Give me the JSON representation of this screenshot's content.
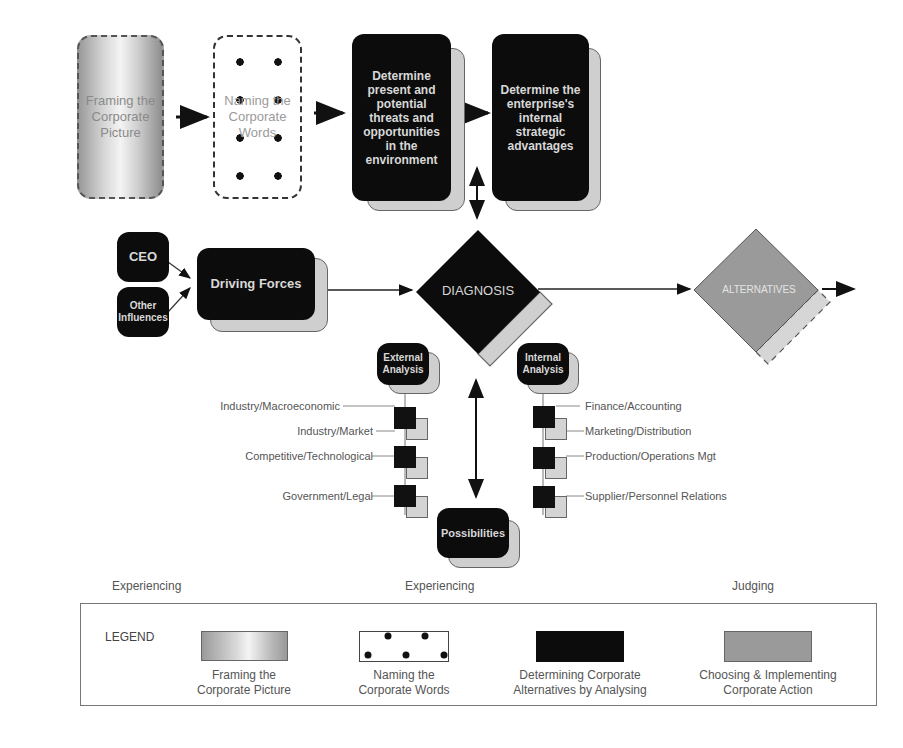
{
  "flow_top": {
    "framing": "Framing the Corporate Picture",
    "naming": "Naming the Corporate Words",
    "threats": "Determine present and potential threats and opportunities in the environment",
    "advantages": "Determine the enterprise's internal strategic advantages"
  },
  "inputs": {
    "ceo": "CEO",
    "other": "Other Influences",
    "driving_forces": "Driving Forces"
  },
  "decision": {
    "diagnosis": "DIAGNOSIS",
    "alternatives": "ALTERNATIVES"
  },
  "external": {
    "title": "External Analysis",
    "items": [
      "Industry/Macroeconomic",
      "Industry/Market",
      "Competitive/Technological",
      "Government/Legal"
    ]
  },
  "internal": {
    "title": "Internal Analysis",
    "items": [
      "Finance/Accounting",
      "Marketing/Distribution",
      "Production/Operations Mgt",
      "Supplier/Personnel Relations"
    ]
  },
  "possibilities": "Possibilities",
  "phases": [
    "Experiencing",
    "Experiencing",
    "Judging"
  ],
  "legend": {
    "title": "LEGEND",
    "items": [
      {
        "line1": "Framing the",
        "line2": "Corporate Picture"
      },
      {
        "line1": "Naming the",
        "line2": "Corporate Words"
      },
      {
        "line1": "Determining Corporate",
        "line2": "Alternatives by Analysing"
      },
      {
        "line1": "Choosing & Implementing",
        "line2": "Corporate Action"
      }
    ]
  },
  "colors": {
    "analysing": "#0c0c0c",
    "choosing": "#9a9a9a",
    "shadow": "#cfcfcf"
  }
}
